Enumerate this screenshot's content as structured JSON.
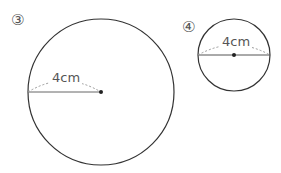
{
  "figures": [
    {
      "id": "3",
      "marker": "③",
      "measure_label": "4cm",
      "measure_type": "radius"
    },
    {
      "id": "4",
      "marker": "④",
      "measure_label": "4cm",
      "measure_type": "diameter"
    }
  ]
}
